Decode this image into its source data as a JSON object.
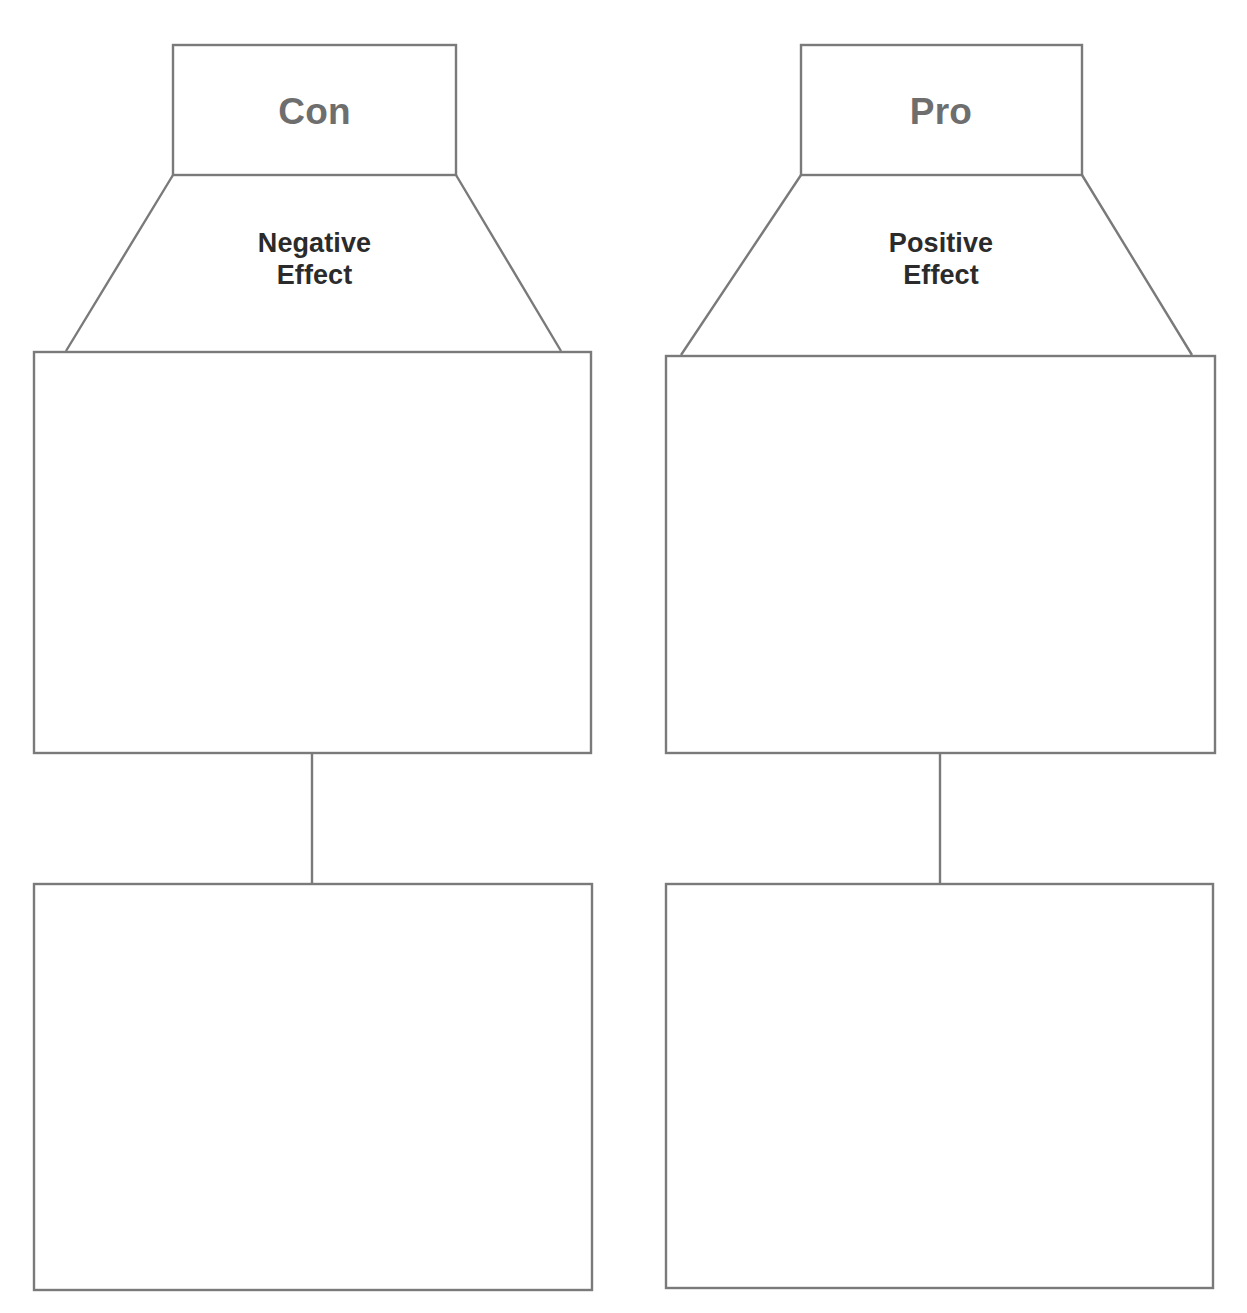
{
  "page": {
    "cropped_top_text": "",
    "background_color": "#ffffff",
    "stroke_color": "#7a7a7a"
  },
  "style": {
    "header_text_color": "#6e6e6e",
    "effect_text_color": "#2b2b2b"
  },
  "columns": [
    {
      "id": "con",
      "header": "Con",
      "effect": "Negative\nEffect",
      "boxes": [
        {
          "name": "evidence-box",
          "value": ""
        },
        {
          "name": "conclusion-box",
          "value": ""
        }
      ]
    },
    {
      "id": "pro",
      "header": "Pro",
      "effect": "Positive\nEffect",
      "boxes": [
        {
          "name": "evidence-box",
          "value": ""
        },
        {
          "name": "conclusion-box",
          "value": ""
        }
      ]
    }
  ]
}
